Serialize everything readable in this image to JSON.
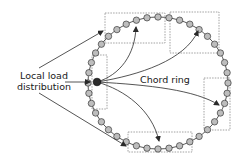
{
  "diagram": {
    "labels": {
      "local_load_line1": "Local load",
      "local_load_line2": "distribution",
      "chord_ring": "Chord ring"
    },
    "colors": {
      "node_fill": "#bdbdbd",
      "node_stroke": "#3a3a3a",
      "source_node_fill": "#2a2a2a",
      "box_stroke": "#8a8a8a",
      "arrow": "#2a2a2a"
    },
    "ring": {
      "cx": 158,
      "cy": 83,
      "rx": 70,
      "ry": 66,
      "node_count": 40,
      "node_radius": 3.2
    },
    "source_node": {
      "x": 97,
      "y": 82
    },
    "boxes": [
      {
        "name": "box-top-left",
        "x": 105,
        "y": 13,
        "w": 60,
        "h": 30
      },
      {
        "name": "box-top-right",
        "x": 170,
        "y": 12,
        "w": 49,
        "h": 41
      },
      {
        "name": "box-left",
        "x": 92,
        "y": 55,
        "w": 15,
        "h": 54
      },
      {
        "name": "box-right",
        "x": 204,
        "y": 78,
        "w": 26,
        "h": 52
      },
      {
        "name": "box-bottom",
        "x": 128,
        "y": 132,
        "w": 64,
        "h": 20
      }
    ],
    "chords": [
      {
        "name": "chord-to-top-left",
        "d": "M97,82 C120,75 135,55 136,27",
        "end": [
          136,
          27
        ]
      },
      {
        "name": "chord-to-top-right",
        "d": "M97,82 C140,75 185,60 198,31",
        "end": [
          198,
          31
        ]
      },
      {
        "name": "chord-to-right",
        "d": "M97,82 C150,85 195,90 219,105",
        "end": [
          219,
          105
        ]
      },
      {
        "name": "chord-to-bottom",
        "d": "M97,82 C125,90 152,110 159,141",
        "end": [
          159,
          141
        ]
      }
    ],
    "pointers": [
      {
        "name": "pointer-to-top-box",
        "x1": 39,
        "y1": 68,
        "x2": 103,
        "y2": 31
      },
      {
        "name": "pointer-to-source",
        "x1": 65,
        "y1": 82,
        "x2": 90,
        "y2": 82
      },
      {
        "name": "pointer-to-bottom-box",
        "x1": 39,
        "y1": 93,
        "x2": 126,
        "y2": 146
      }
    ]
  }
}
